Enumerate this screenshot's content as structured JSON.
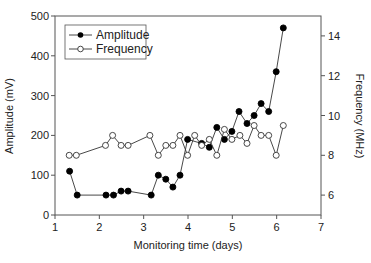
{
  "chart_data": {
    "type": "line",
    "title": "",
    "xlabel": "Monitoring time (days)",
    "ylabel": "Amplitude (mV)",
    "y2label": "Frequency (MHz)",
    "xlim": [
      1,
      7
    ],
    "ylim": [
      0,
      500
    ],
    "y2lim": [
      5,
      15
    ],
    "xticks": [
      1,
      2,
      3,
      4,
      5,
      6,
      7
    ],
    "yticks": [
      0,
      100,
      200,
      300,
      400,
      500
    ],
    "y2ticks": [
      6,
      8,
      10,
      12,
      14
    ],
    "grid": false,
    "legend_position": "upper-left",
    "series": [
      {
        "name": "Amplitude",
        "axis": "left",
        "marker": "filled-circle",
        "x": [
          1.33,
          1.5,
          2.15,
          2.32,
          2.49,
          2.65,
          3.17,
          3.33,
          3.5,
          3.66,
          3.82,
          3.99,
          4.31,
          4.48,
          4.65,
          4.82,
          4.99,
          5.15,
          5.33,
          5.49,
          5.65,
          5.82,
          5.99,
          6.15
        ],
        "values": [
          110,
          50,
          50,
          50,
          60,
          60,
          50,
          100,
          90,
          70,
          100,
          190,
          180,
          170,
          220,
          190,
          210,
          260,
          230,
          250,
          280,
          260,
          360,
          470
        ]
      },
      {
        "name": "Frequency",
        "axis": "right",
        "marker": "open-circle",
        "x": [
          1.32,
          1.48,
          2.14,
          2.3,
          2.49,
          2.65,
          3.14,
          3.33,
          3.5,
          3.66,
          3.82,
          3.99,
          4.15,
          4.31,
          4.48,
          4.65,
          4.82,
          4.99,
          5.17,
          5.33,
          5.49,
          5.65,
          5.82,
          5.99,
          6.15
        ],
        "values": [
          8.0,
          8.0,
          8.5,
          9.0,
          8.5,
          8.5,
          9.0,
          8.0,
          8.5,
          8.5,
          9.0,
          8.0,
          9.0,
          8.5,
          8.8,
          8.0,
          9.3,
          8.8,
          9.0,
          8.6,
          9.5,
          9.0,
          9.0,
          8.0,
          9.5
        ]
      }
    ]
  },
  "legend": {
    "items": [
      {
        "label": "Amplitude"
      },
      {
        "label": "Frequency"
      }
    ]
  },
  "colors": {
    "line": "#333333",
    "axis": "#555555",
    "marker_fill": "#000000",
    "marker_open_fill": "#ffffff"
  }
}
